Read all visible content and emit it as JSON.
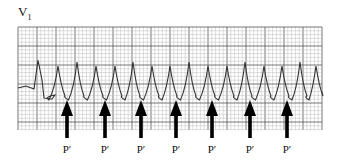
{
  "figure": {
    "lead": {
      "name": "V",
      "subscript": "1"
    },
    "grid": {
      "x": 18,
      "y": 27,
      "width": 304,
      "height": 103,
      "small_step": 3.8,
      "large_step": 19,
      "minor_color": "#bdbdbd",
      "major_color": "#555555"
    },
    "trace_color": "#333333",
    "arrow_color": "#000000",
    "p_wave_label": "P′",
    "arrows": [
      {
        "x": 67,
        "label": "P′"
      },
      {
        "x": 105,
        "label": "P′"
      },
      {
        "x": 141,
        "label": "P′"
      },
      {
        "x": 176,
        "label": "P′"
      },
      {
        "x": 212,
        "label": "P′"
      },
      {
        "x": 250,
        "label": "P′"
      },
      {
        "x": 287,
        "label": "P′"
      }
    ],
    "r_peaks_x": [
      38,
      58,
      77,
      96,
      115,
      133,
      152,
      170,
      189,
      208,
      227,
      245,
      264,
      282,
      300,
      316
    ]
  }
}
